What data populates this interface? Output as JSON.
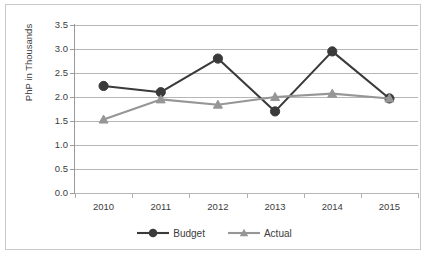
{
  "chart_data": {
    "type": "line",
    "title": "",
    "xlabel": "",
    "ylabel": "PhP in Thousands",
    "categories": [
      "2010",
      "2011",
      "2012",
      "2013",
      "2014",
      "2015"
    ],
    "ylim": [
      0.0,
      3.5
    ],
    "y_ticks": [
      "0.0",
      "0.5",
      "1.0",
      "1.5",
      "2.0",
      "2.5",
      "3.0",
      "3.5"
    ],
    "y_tick_values": [
      0.0,
      0.5,
      1.0,
      1.5,
      2.0,
      2.5,
      3.0,
      3.5
    ],
    "grid": "horizontal",
    "legend_position": "bottom",
    "series": [
      {
        "name": "Budget",
        "color": "#3a3a3a",
        "marker": "circle",
        "values": [
          2.23,
          2.1,
          2.8,
          1.7,
          2.95,
          1.97
        ]
      },
      {
        "name": "Actual",
        "color": "#969696",
        "marker": "triangle",
        "values": [
          1.53,
          1.95,
          1.84,
          2.0,
          2.07,
          1.97
        ]
      }
    ]
  },
  "colors": {
    "budget": "#3a3a3a",
    "actual": "#969696",
    "grid": "#b6b6b6",
    "axis": "#9a9a9a",
    "border": "#c9c9c9",
    "text": "#3c3c3c",
    "background": "#ffffff"
  }
}
